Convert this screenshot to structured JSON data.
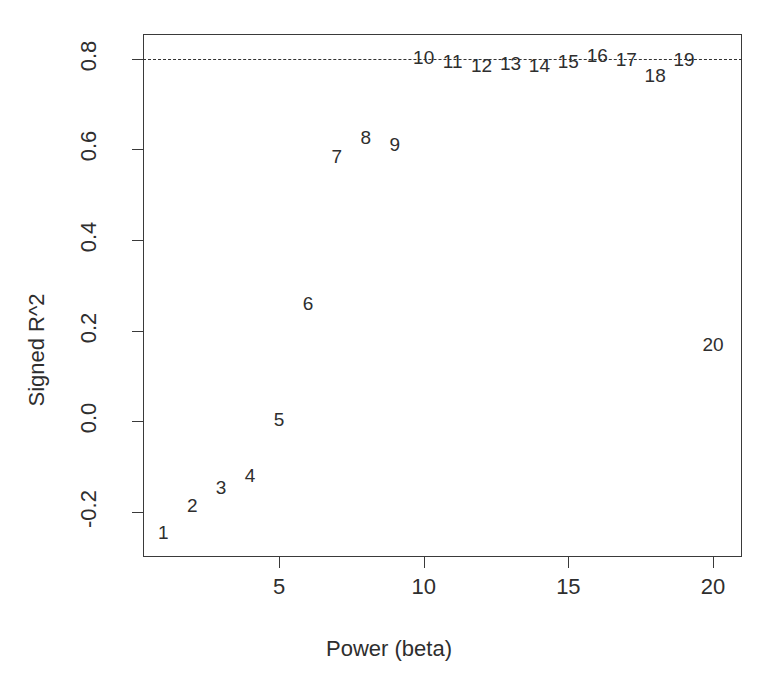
{
  "chart_data": {
    "type": "scatter",
    "title": "",
    "xlabel": "Power (beta)",
    "ylabel": "Signed R^2",
    "xlim": [
      0.3,
      21.0
    ],
    "ylim": [
      -0.3,
      0.855
    ],
    "grid": false,
    "legend": null,
    "marker_style": "numeric-text-label",
    "xticks": [
      5,
      10,
      15,
      20
    ],
    "xticklabels": [
      "5",
      "10",
      "15",
      "20"
    ],
    "yticks": [
      -0.2,
      0.0,
      0.2,
      0.4,
      0.6,
      0.8
    ],
    "yticklabels": [
      "-0.2",
      "0.0",
      "0.2",
      "0.4",
      "0.6",
      "0.8"
    ],
    "annotations": [
      {
        "kind": "hline",
        "name": "threshold-dashed-line",
        "y": 0.8,
        "style": "dashed"
      }
    ],
    "x": [
      1,
      2,
      3,
      4,
      5,
      6,
      7,
      8,
      9,
      10,
      11,
      12,
      13,
      14,
      15,
      16,
      17,
      18,
      19,
      20
    ],
    "y": [
      -0.245,
      -0.185,
      -0.145,
      -0.118,
      0.005,
      0.262,
      0.585,
      0.627,
      0.613,
      0.805,
      0.795,
      0.787,
      0.792,
      0.787,
      0.795,
      0.808,
      0.8,
      0.765,
      0.8,
      0.17
    ],
    "point_labels": [
      "1",
      "2",
      "3",
      "4",
      "5",
      "6",
      "7",
      "8",
      "9",
      "10",
      "11",
      "12",
      "13",
      "14",
      "15",
      "16",
      "17",
      "18",
      "19",
      "20"
    ]
  },
  "axes": {
    "x_title": "Power (beta)",
    "y_title": "Signed R^2"
  }
}
